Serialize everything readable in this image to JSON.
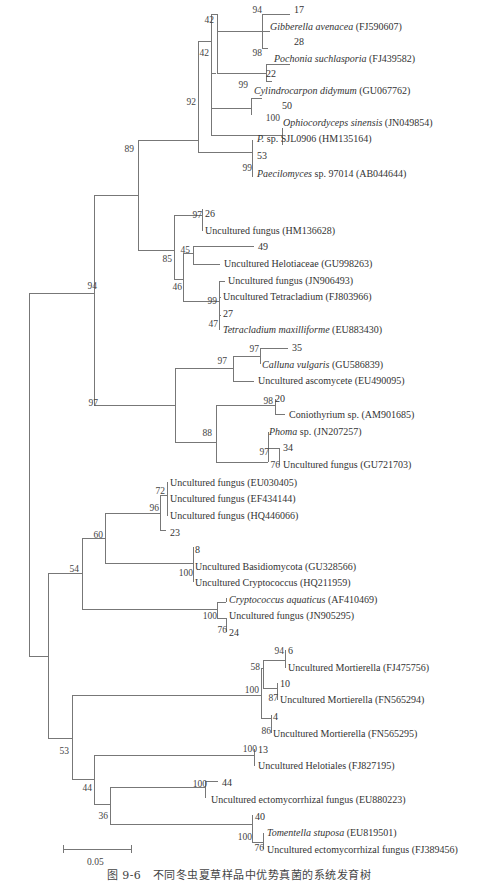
{
  "figure": {
    "caption": "图 9-6　不同冬虫夏草样品中优势真菌的系统发育树",
    "scale_bar_label": "0.05"
  },
  "leaves": [
    {
      "id": "l17",
      "name": "17",
      "acc": "",
      "italic": false,
      "x": 294,
      "y": 5
    },
    {
      "id": "gib",
      "name": "Gibberella avenacea",
      "acc": " (FJ590607)",
      "italic": true,
      "x": 270,
      "y": 22
    },
    {
      "id": "l28",
      "name": "28",
      "acc": "",
      "italic": false,
      "x": 294,
      "y": 37
    },
    {
      "id": "poc",
      "name": "Pochonia suchlasporia",
      "acc": " (FJ439582)",
      "italic": true,
      "x": 274,
      "y": 54
    },
    {
      "id": "l22",
      "name": "22",
      "acc": "",
      "italic": false,
      "x": 266,
      "y": 69
    },
    {
      "id": "cyl",
      "name": "Cylindrocarpon didymum",
      "acc": " (GU067762)",
      "italic": true,
      "x": 254,
      "y": 86
    },
    {
      "id": "l50",
      "name": "50",
      "acc": "",
      "italic": false,
      "x": 282,
      "y": 101
    },
    {
      "id": "oph",
      "name": "Ophiocordyceps sinensis",
      "acc": " (JN049854)",
      "italic": true,
      "x": 283,
      "y": 118
    },
    {
      "id": "psp",
      "name": "P.",
      "acc": " sp. SJL0906 (HM135164)",
      "italic": true,
      "x": 257,
      "y": 134
    },
    {
      "id": "l53",
      "name": "53",
      "acc": "",
      "italic": false,
      "x": 257,
      "y": 151
    },
    {
      "id": "pae",
      "name": "Paecilomyces",
      "acc": " sp. 97014 (AB044644)",
      "italic": true,
      "x": 257,
      "y": 169
    },
    {
      "id": "l26",
      "name": "26",
      "acc": "",
      "italic": false,
      "x": 205,
      "y": 209
    },
    {
      "id": "unf1",
      "name": "Uncultured fungus (HM136628)",
      "acc": "",
      "italic": false,
      "x": 205,
      "y": 226
    },
    {
      "id": "l49",
      "name": "49",
      "acc": "",
      "italic": false,
      "x": 258,
      "y": 242
    },
    {
      "id": "hel",
      "name": "Uncultured Helotiaceae (GU998263)",
      "acc": "",
      "italic": false,
      "x": 224,
      "y": 259
    },
    {
      "id": "unf2",
      "name": "Uncultured fungus (JN906493)",
      "acc": "",
      "italic": false,
      "x": 228,
      "y": 276
    },
    {
      "id": "tet",
      "name": "Uncultured Tetracladium (FJ803966)",
      "acc": "",
      "italic": false,
      "x": 223,
      "y": 292
    },
    {
      "id": "l27",
      "name": "27",
      "acc": "",
      "italic": false,
      "x": 223,
      "y": 309
    },
    {
      "id": "tmax",
      "name": "Tetracladium maxilliforme",
      "acc": " (EU883430)",
      "italic": true,
      "x": 223,
      "y": 325
    },
    {
      "id": "l35",
      "name": "35",
      "acc": "",
      "italic": false,
      "x": 292,
      "y": 343
    },
    {
      "id": "cal",
      "name": "Calluna vulgaris",
      "acc": " (GU586839)",
      "italic": true,
      "x": 262,
      "y": 360
    },
    {
      "id": "asc",
      "name": "Uncultured ascomycete (EU490095)",
      "acc": "",
      "italic": false,
      "x": 258,
      "y": 376
    },
    {
      "id": "l20",
      "name": "20",
      "acc": "",
      "italic": false,
      "x": 275,
      "y": 394
    },
    {
      "id": "con",
      "name": "Coniothyrium sp. (AM901685)",
      "acc": "",
      "italic": false,
      "x": 289,
      "y": 410
    },
    {
      "id": "pho",
      "name": "Phoma",
      "acc": " sp. (JN207257)",
      "italic": true,
      "x": 269,
      "y": 427
    },
    {
      "id": "l34",
      "name": "34",
      "acc": "",
      "italic": false,
      "x": 283,
      "y": 443
    },
    {
      "id": "unf3",
      "name": "Uncultured fungus (GU721703)",
      "acc": "",
      "italic": false,
      "x": 283,
      "y": 460
    },
    {
      "id": "unf4",
      "name": "Uncultured fungus (EU030405)",
      "acc": "",
      "italic": false,
      "x": 170,
      "y": 478
    },
    {
      "id": "unf5",
      "name": "Uncultured fungus (EF434144)",
      "acc": "",
      "italic": false,
      "x": 170,
      "y": 494
    },
    {
      "id": "unf6",
      "name": "Uncultured fungus (HQ446066)",
      "acc": "",
      "italic": false,
      "x": 170,
      "y": 511
    },
    {
      "id": "l23",
      "name": "23",
      "acc": "",
      "italic": false,
      "x": 170,
      "y": 528
    },
    {
      "id": "l8",
      "name": "8",
      "acc": "",
      "italic": false,
      "x": 195,
      "y": 545
    },
    {
      "id": "bas",
      "name": "Uncultured Basidiomycota (GU328566)",
      "acc": "",
      "italic": false,
      "x": 195,
      "y": 562
    },
    {
      "id": "cry",
      "name": "Uncultured Cryptococcus (HQ211959)",
      "acc": "",
      "italic": false,
      "x": 195,
      "y": 578
    },
    {
      "id": "caq",
      "name": "Cryptococcus aquaticus",
      "acc": " (AF410469)",
      "italic": true,
      "x": 229,
      "y": 595
    },
    {
      "id": "unf7",
      "name": "Uncultured fungus (JN905295)",
      "acc": "",
      "italic": false,
      "x": 229,
      "y": 611
    },
    {
      "id": "l24",
      "name": "24",
      "acc": "",
      "italic": false,
      "x": 229,
      "y": 628
    },
    {
      "id": "l6",
      "name": "6",
      "acc": "",
      "italic": false,
      "x": 288,
      "y": 646
    },
    {
      "id": "mor1",
      "name": "Uncultured Mortierella (FJ475756)",
      "acc": "",
      "italic": false,
      "x": 288,
      "y": 663
    },
    {
      "id": "l10",
      "name": "10",
      "acc": "",
      "italic": false,
      "x": 280,
      "y": 679
    },
    {
      "id": "mor2",
      "name": "Uncultured Mortierella (FN565294)",
      "acc": "",
      "italic": false,
      "x": 280,
      "y": 695
    },
    {
      "id": "l4",
      "name": "4",
      "acc": "",
      "italic": false,
      "x": 273,
      "y": 712
    },
    {
      "id": "mor3",
      "name": "Uncultured Mortierella (FN565295)",
      "acc": "",
      "italic": false,
      "x": 273,
      "y": 729
    },
    {
      "id": "l13",
      "name": "13",
      "acc": "",
      "italic": false,
      "x": 258,
      "y": 745
    },
    {
      "id": "hlt",
      "name": "Uncultured Helotiales (FJ827195)",
      "acc": "",
      "italic": false,
      "x": 258,
      "y": 761
    },
    {
      "id": "l44",
      "name": "44",
      "acc": "",
      "italic": false,
      "x": 222,
      "y": 778
    },
    {
      "id": "ecto1",
      "name": "Uncultured ectomycorrhizal fungus (EU880223)",
      "acc": "",
      "italic": false,
      "x": 211,
      "y": 795
    },
    {
      "id": "l40",
      "name": "40",
      "acc": "",
      "italic": false,
      "x": 255,
      "y": 812
    },
    {
      "id": "tom",
      "name": "Tomentella stuposa",
      "acc": " (EU819501)",
      "italic": true,
      "x": 267,
      "y": 828
    },
    {
      "id": "ecto2",
      "name": "Uncultured ectomycorrhizal fungus (FJ389456)",
      "acc": "",
      "italic": false,
      "x": 267,
      "y": 845
    }
  ],
  "bootstrap": [
    {
      "v": "94",
      "x": 262,
      "y": 5
    },
    {
      "v": "42",
      "x": 214,
      "y": 15
    },
    {
      "v": "98",
      "x": 262,
      "y": 48
    },
    {
      "v": "42",
      "x": 209,
      "y": 48
    },
    {
      "v": "99",
      "x": 248,
      "y": 80
    },
    {
      "v": "92",
      "x": 196,
      "y": 97
    },
    {
      "v": "100",
      "x": 280,
      "y": 113
    },
    {
      "v": "99",
      "x": 252,
      "y": 163
    },
    {
      "v": "89",
      "x": 134,
      "y": 144
    },
    {
      "v": "94",
      "x": 97,
      "y": 281
    },
    {
      "v": "97",
      "x": 202,
      "y": 210
    },
    {
      "v": "85",
      "x": 172,
      "y": 254
    },
    {
      "v": "45",
      "x": 190,
      "y": 245
    },
    {
      "v": "46",
      "x": 182,
      "y": 282
    },
    {
      "v": "99",
      "x": 217,
      "y": 296
    },
    {
      "v": "47",
      "x": 218,
      "y": 319
    },
    {
      "v": "97",
      "x": 259,
      "y": 344
    },
    {
      "v": "97",
      "x": 227,
      "y": 356
    },
    {
      "v": "97",
      "x": 98,
      "y": 398
    },
    {
      "v": "98",
      "x": 273,
      "y": 396
    },
    {
      "v": "88",
      "x": 212,
      "y": 428
    },
    {
      "v": "97",
      "x": 269,
      "y": 447
    },
    {
      "v": "76",
      "x": 280,
      "y": 460
    },
    {
      "v": "72",
      "x": 165,
      "y": 486
    },
    {
      "v": "96",
      "x": 159,
      "y": 503
    },
    {
      "v": "60",
      "x": 103,
      "y": 530
    },
    {
      "v": "100",
      "x": 193,
      "y": 568
    },
    {
      "v": "54",
      "x": 79,
      "y": 564
    },
    {
      "v": "100",
      "x": 217,
      "y": 611
    },
    {
      "v": "76",
      "x": 227,
      "y": 625
    },
    {
      "v": "94",
      "x": 284,
      "y": 646
    },
    {
      "v": "58",
      "x": 260,
      "y": 662
    },
    {
      "v": "100",
      "x": 259,
      "y": 685
    },
    {
      "v": "87",
      "x": 278,
      "y": 693
    },
    {
      "v": "86",
      "x": 271,
      "y": 726
    },
    {
      "v": "100",
      "x": 257,
      "y": 744
    },
    {
      "v": "53",
      "x": 69,
      "y": 746
    },
    {
      "v": "44",
      "x": 92,
      "y": 783
    },
    {
      "v": "100",
      "x": 207,
      "y": 779
    },
    {
      "v": "36",
      "x": 108,
      "y": 811
    },
    {
      "v": "100",
      "x": 252,
      "y": 832
    },
    {
      "v": "76",
      "x": 264,
      "y": 843
    }
  ],
  "icons": {}
}
